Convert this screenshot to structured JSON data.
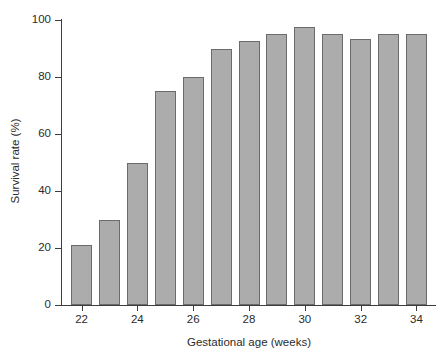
{
  "chart_data": {
    "type": "bar",
    "title": "",
    "xlabel": "Gestational age (weeks)",
    "ylabel": "Survival rate (%)",
    "categories": [
      "22",
      "23",
      "24",
      "25",
      "26",
      "27",
      "28",
      "29",
      "30",
      "31",
      "32",
      "33",
      "34"
    ],
    "values": [
      21,
      30,
      50,
      75,
      80,
      90,
      92.5,
      95,
      97.5,
      95,
      93.5,
      95,
      95
    ],
    "xlim": [
      21.3,
      34.7
    ],
    "ylim": [
      0,
      100
    ],
    "y_ticks": [
      0,
      20,
      40,
      60,
      80,
      100
    ],
    "y_tick_labels": [
      "0",
      "20",
      "40",
      "60",
      "80",
      "100"
    ],
    "x_ticks": [
      22,
      24,
      26,
      28,
      30,
      32,
      34
    ],
    "x_tick_labels": [
      "22",
      "24",
      "26",
      "28",
      "30",
      "32",
      "34"
    ],
    "grid": false,
    "legend": null,
    "bar_color": "#acacac",
    "bar_edge_color": "#6b6b6b",
    "axis_color": "#3d3d3d",
    "background_color": "#ffffff"
  }
}
